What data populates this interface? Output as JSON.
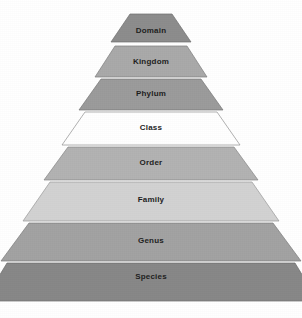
{
  "figure": {
    "name": "taxonomic-rank-pyramid",
    "background_color": "#ffffff"
  },
  "chart_data": {
    "type": "pyramid",
    "title": "",
    "orientation": "apex-top",
    "categories": [
      "Domain",
      "Kingdom",
      "Phylum",
      "Class",
      "Order",
      "Family",
      "Genus",
      "Species"
    ],
    "values": [
      1,
      2,
      3,
      4,
      5,
      6,
      7,
      8
    ],
    "xlabel": "",
    "ylabel": "",
    "legend": [],
    "grid": false,
    "tiers": [
      {
        "label": "Domain",
        "rank": 1,
        "fill": "#8c8c8c",
        "stroke": "#6e6e6e",
        "top_y": 14,
        "bottom_y": 42,
        "top_half_width": 21,
        "bottom_half_width": 40,
        "label_x": 151,
        "label_y": 31
      },
      {
        "label": "Kingdom",
        "rank": 2,
        "fill": "#a9a9a9",
        "stroke": "#7d7d7d",
        "top_y": 46,
        "bottom_y": 77,
        "top_half_width": 36,
        "bottom_half_width": 56,
        "label_x": 151,
        "label_y": 62
      },
      {
        "label": "Phylum",
        "rank": 3,
        "fill": "#9b9b9b",
        "stroke": "#757575",
        "top_y": 79,
        "bottom_y": 110,
        "top_half_width": 50,
        "bottom_half_width": 72,
        "label_x": 151,
        "label_y": 94
      },
      {
        "label": "Class",
        "rank": 4,
        "fill": "#ffffff",
        "stroke": "#8f8f8f",
        "top_y": 112,
        "bottom_y": 145,
        "top_half_width": 66,
        "bottom_half_width": 89,
        "label_x": 151,
        "label_y": 128
      },
      {
        "label": "Order",
        "rank": 5,
        "fill": "#b2b2b2",
        "stroke": "#878787",
        "top_y": 147,
        "bottom_y": 180,
        "top_half_width": 83,
        "bottom_half_width": 107,
        "label_x": 151,
        "label_y": 163
      },
      {
        "label": "Family",
        "rank": 6,
        "fill": "#d2d2d2",
        "stroke": "#9a9a9a",
        "top_y": 182,
        "bottom_y": 221,
        "top_half_width": 101,
        "bottom_half_width": 128,
        "label_x": 151,
        "label_y": 200
      },
      {
        "label": "Genus",
        "rank": 7,
        "fill": "#a2a2a2",
        "stroke": "#7b7b7b",
        "top_y": 223,
        "bottom_y": 261,
        "top_half_width": 122,
        "bottom_half_width": 150,
        "label_x": 151,
        "label_y": 241
      },
      {
        "label": "Species",
        "rank": 8,
        "fill": "#878787",
        "stroke": "#6b6b6b",
        "top_y": 263,
        "bottom_y": 301,
        "top_half_width": 144,
        "bottom_half_width": 167,
        "label_x": 151,
        "label_y": 277
      }
    ],
    "center_x": 151
  }
}
